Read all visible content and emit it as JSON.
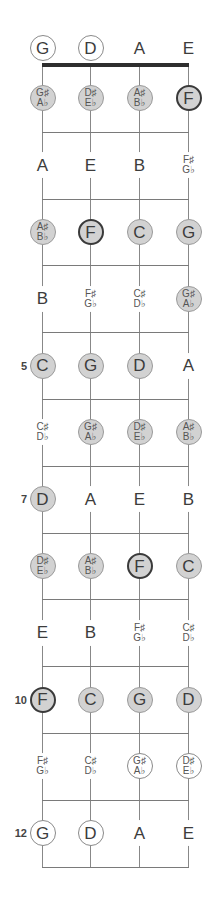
{
  "diagram": {
    "strings": [
      "G",
      "D",
      "A",
      "E"
    ],
    "string_x": [
      42,
      90,
      139,
      188
    ],
    "nut_y": 65,
    "fret_spacing": 66.8,
    "fret_count": 12,
    "open_row_y": 48,
    "colors": {
      "filled": "#d2d2d2",
      "root_border": "#3a3a3a",
      "line": "#7a7a7a",
      "nut": "#2e2e2e"
    },
    "position_markers": [
      {
        "fret": 5,
        "label": "5"
      },
      {
        "fret": 7,
        "label": "7"
      },
      {
        "fret": 10,
        "label": "10"
      },
      {
        "fret": 12,
        "label": "12"
      }
    ],
    "rows": [
      {
        "fret": 0,
        "notes": [
          {
            "label": [
              "G"
            ],
            "style": "open"
          },
          {
            "label": [
              "D"
            ],
            "style": "open"
          },
          {
            "label": [
              "A"
            ],
            "style": "plain"
          },
          {
            "label": [
              "E"
            ],
            "style": "plain"
          }
        ]
      },
      {
        "fret": 1,
        "notes": [
          {
            "label": [
              "G♯",
              "A♭"
            ],
            "style": "filled"
          },
          {
            "label": [
              "D♯",
              "E♭"
            ],
            "style": "filled"
          },
          {
            "label": [
              "A♯",
              "B♭"
            ],
            "style": "filled"
          },
          {
            "label": [
              "F"
            ],
            "style": "root"
          }
        ]
      },
      {
        "fret": 2,
        "notes": [
          {
            "label": [
              "A"
            ],
            "style": "plain"
          },
          {
            "label": [
              "E"
            ],
            "style": "plain"
          },
          {
            "label": [
              "B"
            ],
            "style": "plain"
          },
          {
            "label": [
              "F♯",
              "G♭"
            ],
            "style": "plain"
          }
        ]
      },
      {
        "fret": 3,
        "notes": [
          {
            "label": [
              "A♯",
              "B♭"
            ],
            "style": "filled"
          },
          {
            "label": [
              "F"
            ],
            "style": "root"
          },
          {
            "label": [
              "C"
            ],
            "style": "filled"
          },
          {
            "label": [
              "G"
            ],
            "style": "filled"
          }
        ]
      },
      {
        "fret": 4,
        "notes": [
          {
            "label": [
              "B"
            ],
            "style": "plain"
          },
          {
            "label": [
              "F♯",
              "G♭"
            ],
            "style": "plain"
          },
          {
            "label": [
              "C♯",
              "D♭"
            ],
            "style": "plain"
          },
          {
            "label": [
              "G♯",
              "A♭"
            ],
            "style": "filled"
          }
        ]
      },
      {
        "fret": 5,
        "notes": [
          {
            "label": [
              "C"
            ],
            "style": "filled"
          },
          {
            "label": [
              "G"
            ],
            "style": "filled"
          },
          {
            "label": [
              "D"
            ],
            "style": "filled"
          },
          {
            "label": [
              "A"
            ],
            "style": "plain"
          }
        ]
      },
      {
        "fret": 6,
        "notes": [
          {
            "label": [
              "C♯",
              "D♭"
            ],
            "style": "plain"
          },
          {
            "label": [
              "G♯",
              "A♭"
            ],
            "style": "filled"
          },
          {
            "label": [
              "D♯",
              "E♭"
            ],
            "style": "filled"
          },
          {
            "label": [
              "A♯",
              "B♭"
            ],
            "style": "filled"
          }
        ]
      },
      {
        "fret": 7,
        "notes": [
          {
            "label": [
              "D"
            ],
            "style": "filled"
          },
          {
            "label": [
              "A"
            ],
            "style": "plain"
          },
          {
            "label": [
              "E"
            ],
            "style": "plain"
          },
          {
            "label": [
              "B"
            ],
            "style": "plain"
          }
        ]
      },
      {
        "fret": 8,
        "notes": [
          {
            "label": [
              "D♯",
              "E♭"
            ],
            "style": "filled"
          },
          {
            "label": [
              "A♯",
              "B♭"
            ],
            "style": "filled"
          },
          {
            "label": [
              "F"
            ],
            "style": "root"
          },
          {
            "label": [
              "C"
            ],
            "style": "filled"
          }
        ]
      },
      {
        "fret": 9,
        "notes": [
          {
            "label": [
              "E"
            ],
            "style": "plain"
          },
          {
            "label": [
              "B"
            ],
            "style": "plain"
          },
          {
            "label": [
              "F♯",
              "G♭"
            ],
            "style": "plain"
          },
          {
            "label": [
              "C♯",
              "D♭"
            ],
            "style": "plain"
          }
        ]
      },
      {
        "fret": 10,
        "notes": [
          {
            "label": [
              "F"
            ],
            "style": "root"
          },
          {
            "label": [
              "C"
            ],
            "style": "filled"
          },
          {
            "label": [
              "G"
            ],
            "style": "filled"
          },
          {
            "label": [
              "D"
            ],
            "style": "filled"
          }
        ]
      },
      {
        "fret": 11,
        "notes": [
          {
            "label": [
              "F♯",
              "G♭"
            ],
            "style": "plain"
          },
          {
            "label": [
              "C♯",
              "D♭"
            ],
            "style": "plain"
          },
          {
            "label": [
              "G♯",
              "A♭"
            ],
            "style": "open"
          },
          {
            "label": [
              "D♯",
              "E♭"
            ],
            "style": "open"
          }
        ]
      },
      {
        "fret": 12,
        "notes": [
          {
            "label": [
              "G"
            ],
            "style": "open"
          },
          {
            "label": [
              "D"
            ],
            "style": "open"
          },
          {
            "label": [
              "A"
            ],
            "style": "plain"
          },
          {
            "label": [
              "E"
            ],
            "style": "plain"
          }
        ]
      }
    ]
  }
}
